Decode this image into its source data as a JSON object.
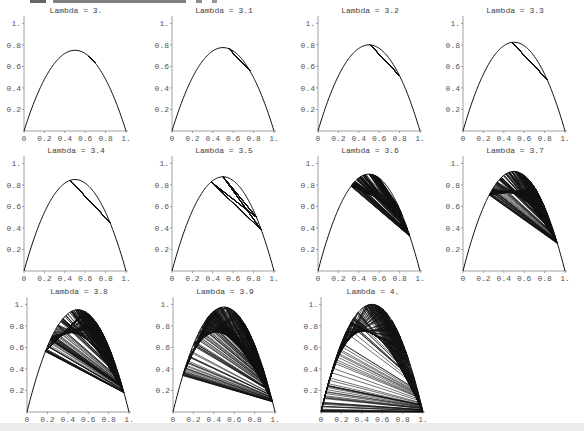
{
  "chart_data": [
    {
      "type": "line",
      "title": "Lambda = 3.",
      "lambda": 3.0,
      "xlabel": "",
      "ylabel": "",
      "xlim": [
        0,
        1
      ],
      "ylim": [
        0,
        1.05
      ],
      "x_ticks": [
        "0",
        "0.2",
        "0.4",
        "0.6",
        "0.8",
        "1."
      ],
      "y_ticks": [
        "0.2",
        "0.4",
        "0.6",
        "0.8",
        "1."
      ],
      "grid": false,
      "legend": null,
      "series": [
        {
          "name": "f(x) = lambda x (1-x)",
          "peak": 0.75
        },
        {
          "name": "cobweb iterations",
          "approx_range": [
            0.66,
            0.68
          ]
        }
      ]
    },
    {
      "type": "line",
      "title": "Lambda = 3.1",
      "lambda": 3.1,
      "xlabel": "",
      "ylabel": "",
      "xlim": [
        0,
        1
      ],
      "ylim": [
        0,
        1.05
      ],
      "x_ticks": [
        "0",
        "0.2",
        "0.4",
        "0.6",
        "0.8",
        "1."
      ],
      "y_ticks": [
        "0.2",
        "0.4",
        "0.6",
        "0.8",
        "1."
      ],
      "grid": false,
      "legend": null,
      "series": [
        {
          "name": "f(x) = lambda x (1-x)",
          "peak": 0.775
        },
        {
          "name": "cobweb iterations",
          "period": 2,
          "cycle": [
            0.558,
            0.765
          ]
        }
      ]
    },
    {
      "type": "line",
      "title": "Lambda = 3.2",
      "lambda": 3.2,
      "xlabel": "",
      "ylabel": "",
      "xlim": [
        0,
        1
      ],
      "ylim": [
        0,
        1.05
      ],
      "x_ticks": [
        "0",
        "0.2",
        "0.4",
        "0.6",
        "0.8",
        "1."
      ],
      "y_ticks": [
        "0.2",
        "0.4",
        "0.6",
        "0.8",
        "1."
      ],
      "grid": false,
      "legend": null,
      "series": [
        {
          "name": "f(x) = lambda x (1-x)",
          "peak": 0.8
        },
        {
          "name": "cobweb iterations",
          "period": 2,
          "cycle": [
            0.513,
            0.799
          ]
        }
      ]
    },
    {
      "type": "line",
      "title": "Lambda = 3.3",
      "lambda": 3.3,
      "xlabel": "",
      "ylabel": "",
      "xlim": [
        0,
        1
      ],
      "ylim": [
        0,
        1.05
      ],
      "x_ticks": [
        "0",
        "0.2",
        "0.4",
        "0.6",
        "0.8",
        "1."
      ],
      "y_ticks": [
        "0.2",
        "0.4",
        "0.6",
        "0.8",
        "1."
      ],
      "grid": false,
      "legend": null,
      "series": [
        {
          "name": "f(x) = lambda x (1-x)",
          "peak": 0.825
        },
        {
          "name": "cobweb iterations",
          "period": 2,
          "cycle": [
            0.479,
            0.824
          ]
        }
      ]
    },
    {
      "type": "line",
      "title": "Lambda = 3.4",
      "lambda": 3.4,
      "xlabel": "",
      "ylabel": "",
      "xlim": [
        0,
        1
      ],
      "ylim": [
        0,
        1.05
      ],
      "x_ticks": [
        "0",
        "0.2",
        "0.4",
        "0.6",
        "0.8",
        "1."
      ],
      "y_ticks": [
        "0.2",
        "0.4",
        "0.6",
        "0.8",
        "1."
      ],
      "grid": false,
      "legend": null,
      "series": [
        {
          "name": "f(x) = lambda x (1-x)",
          "peak": 0.85
        },
        {
          "name": "cobweb iterations",
          "period": 2,
          "cycle": [
            0.452,
            0.842
          ]
        }
      ]
    },
    {
      "type": "line",
      "title": "Lambda = 3.5",
      "lambda": 3.5,
      "xlabel": "",
      "ylabel": "",
      "xlim": [
        0,
        1
      ],
      "ylim": [
        0,
        1.05
      ],
      "x_ticks": [
        "0",
        "0.2",
        "0.4",
        "0.6",
        "0.8",
        "1."
      ],
      "y_ticks": [
        "0.2",
        "0.4",
        "0.6",
        "0.8",
        "1."
      ],
      "grid": false,
      "legend": null,
      "series": [
        {
          "name": "f(x) = lambda x (1-x)",
          "peak": 0.875
        },
        {
          "name": "cobweb iterations",
          "period": 4,
          "cycle": [
            0.383,
            0.827,
            0.501,
            0.875
          ]
        }
      ]
    },
    {
      "type": "line",
      "title": "Lambda = 3.6",
      "lambda": 3.6,
      "xlabel": "",
      "ylabel": "",
      "xlim": [
        0,
        1
      ],
      "ylim": [
        0,
        1.05
      ],
      "x_ticks": [
        "0",
        "0.2",
        "0.4",
        "0.6",
        "0.8",
        "1."
      ],
      "y_ticks": [
        "0.2",
        "0.4",
        "0.6",
        "0.8",
        "1."
      ],
      "grid": false,
      "legend": null,
      "series": [
        {
          "name": "f(x) = lambda x (1-x)",
          "peak": 0.9
        },
        {
          "name": "cobweb iterations",
          "approx_range": [
            0.32,
            0.9
          ]
        }
      ]
    },
    {
      "type": "line",
      "title": "Lambda = 3.7",
      "lambda": 3.7,
      "xlabel": "",
      "ylabel": "",
      "xlim": [
        0,
        1
      ],
      "ylim": [
        0,
        1.05
      ],
      "x_ticks": [
        "0",
        "0.2",
        "0.4",
        "0.6",
        "0.8",
        "1."
      ],
      "y_ticks": [
        "0.2",
        "0.4",
        "0.6",
        "0.8",
        "1."
      ],
      "grid": false,
      "legend": null,
      "series": [
        {
          "name": "f(x) = lambda x (1-x)",
          "peak": 0.925
        },
        {
          "name": "cobweb iterations",
          "approx_range": [
            0.25,
            0.925
          ]
        }
      ]
    },
    {
      "type": "line",
      "title": "Lambda = 3.8",
      "lambda": 3.8,
      "xlabel": "",
      "ylabel": "",
      "xlim": [
        0,
        1
      ],
      "ylim": [
        0,
        1.05
      ],
      "x_ticks": [
        "0",
        "0.2",
        "0.4",
        "0.6",
        "0.8",
        "1."
      ],
      "y_ticks": [
        "0.2",
        "0.4",
        "0.6",
        "0.8",
        "1."
      ],
      "grid": false,
      "legend": null,
      "series": [
        {
          "name": "f(x) = lambda x (1-x)",
          "peak": 0.95
        },
        {
          "name": "cobweb iterations",
          "approx_range": [
            0.18,
            0.95
          ]
        }
      ]
    },
    {
      "type": "line",
      "title": "Lambda = 3.9",
      "lambda": 3.9,
      "xlabel": "",
      "ylabel": "",
      "xlim": [
        0,
        1
      ],
      "ylim": [
        0,
        1.05
      ],
      "x_ticks": [
        "0",
        "0.2",
        "0.4",
        "0.6",
        "0.8",
        "1."
      ],
      "y_ticks": [
        "0.2",
        "0.4",
        "0.6",
        "0.8",
        "1."
      ],
      "grid": false,
      "legend": null,
      "series": [
        {
          "name": "f(x) = lambda x (1-x)",
          "peak": 0.975
        },
        {
          "name": "cobweb iterations",
          "approx_range": [
            0.1,
            0.975
          ]
        }
      ]
    },
    {
      "type": "line",
      "title": "Lambda = 4.",
      "lambda": 4.0,
      "xlabel": "",
      "ylabel": "",
      "xlim": [
        0,
        1
      ],
      "ylim": [
        0,
        1.05
      ],
      "x_ticks": [
        "0",
        "0.2",
        "0.4",
        "0.6",
        "0.8",
        "1."
      ],
      "y_ticks": [
        "0.2",
        "0.4",
        "0.6",
        "0.8",
        "1."
      ],
      "grid": false,
      "legend": null,
      "series": [
        {
          "name": "f(x) = lambda x (1-x)",
          "peak": 1.0
        },
        {
          "name": "cobweb iterations",
          "approx_range": [
            0.0,
            1.0
          ]
        }
      ]
    }
  ],
  "panels": [
    {
      "title": "Lambda = 3.",
      "lambda": 3.0,
      "iterations": 60,
      "x0": 0.2
    },
    {
      "title": "Lambda = 3.1",
      "lambda": 3.1,
      "iterations": 60,
      "x0": 0.2
    },
    {
      "title": "Lambda = 3.2",
      "lambda": 3.2,
      "iterations": 60,
      "x0": 0.2
    },
    {
      "title": "Lambda = 3.3",
      "lambda": 3.3,
      "iterations": 60,
      "x0": 0.2
    },
    {
      "title": "Lambda = 3.4",
      "lambda": 3.4,
      "iterations": 60,
      "x0": 0.2
    },
    {
      "title": "Lambda = 3.5",
      "lambda": 3.5,
      "iterations": 60,
      "x0": 0.2
    },
    {
      "title": "Lambda = 3.6",
      "lambda": 3.6,
      "iterations": 200,
      "x0": 0.2
    },
    {
      "title": "Lambda = 3.7",
      "lambda": 3.7,
      "iterations": 300,
      "x0": 0.2
    },
    {
      "title": "Lambda = 3.8",
      "lambda": 3.8,
      "iterations": 300,
      "x0": 0.2
    },
    {
      "title": "Lambda = 3.9",
      "lambda": 3.9,
      "iterations": 300,
      "x0": 0.2
    },
    {
      "title": "Lambda = 4.",
      "lambda": 4.0,
      "iterations": 300,
      "x0": 0.2
    }
  ],
  "axes": {
    "x_ticks": [
      "0",
      "0.2",
      "0.4",
      "0.6",
      "0.8",
      "1."
    ],
    "y_ticks": [
      "0.2",
      "0.4",
      "0.6",
      "0.8",
      "1."
    ]
  },
  "colors": {
    "line": "#111111",
    "axis": "#888888",
    "text": "#555555"
  }
}
